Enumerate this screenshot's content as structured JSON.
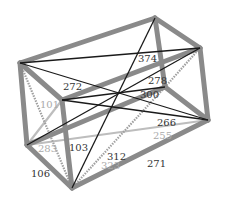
{
  "diagram": {
    "type": "3d-box-wireframe",
    "colors": {
      "edge": "#8a8a8a",
      "diagonal_dark": "#1a1a1a",
      "diagonal_light": "#bdbdbd",
      "dashed": "#a0a0a0",
      "label_dark": "#333333",
      "label_light": "#aaaaaa"
    },
    "vertices": {
      "A": [
        20,
        63
      ],
      "B": [
        155,
        18
      ],
      "C": [
        200,
        48
      ],
      "D": [
        62,
        100
      ],
      "E": [
        27,
        145
      ],
      "F": [
        72,
        188
      ],
      "G": [
        208,
        120
      ],
      "H": [
        165,
        87
      ]
    },
    "edges": [
      {
        "from": "A",
        "to": "B",
        "style": "edge"
      },
      {
        "from": "B",
        "to": "C",
        "style": "edge"
      },
      {
        "from": "C",
        "to": "D",
        "style": "edge"
      },
      {
        "from": "D",
        "to": "A",
        "style": "edge"
      },
      {
        "from": "A",
        "to": "E",
        "style": "edge"
      },
      {
        "from": "D",
        "to": "F",
        "style": "edge"
      },
      {
        "from": "C",
        "to": "G",
        "style": "edge"
      },
      {
        "from": "B",
        "to": "H",
        "style": "edge"
      },
      {
        "from": "E",
        "to": "F",
        "style": "edge"
      },
      {
        "from": "F",
        "to": "G",
        "style": "edge"
      },
      {
        "from": "G",
        "to": "H",
        "style": "edge"
      },
      {
        "from": "H",
        "to": "E",
        "style": "edge"
      }
    ],
    "diagonals": [
      {
        "from": "A",
        "to": "G",
        "style": "dark"
      },
      {
        "from": "B",
        "to": "F",
        "style": "dark"
      },
      {
        "from": "C",
        "to": "E",
        "style": "dark"
      },
      {
        "from": "D",
        "to": "H",
        "style": "dark"
      },
      {
        "from": "A",
        "to": "C",
        "style": "dark"
      },
      {
        "from": "D",
        "to": "G",
        "style": "dark"
      },
      {
        "from": "E",
        "to": "G",
        "style": "light"
      },
      {
        "from": "D",
        "to": "E",
        "style": "light"
      },
      {
        "from": "A",
        "to": "F",
        "style": "dashed"
      },
      {
        "from": "F",
        "to": "H",
        "style": "dashed"
      },
      {
        "from": "C",
        "to": "H",
        "style": "dashed"
      }
    ],
    "labels": [
      {
        "text": "374",
        "x": 138,
        "y": 62,
        "tone": "dark"
      },
      {
        "text": "272",
        "x": 63,
        "y": 90,
        "tone": "dark"
      },
      {
        "text": "278",
        "x": 148,
        "y": 84,
        "tone": "dark"
      },
      {
        "text": "300",
        "x": 140,
        "y": 98,
        "tone": "dark"
      },
      {
        "text": "101",
        "x": 40,
        "y": 108,
        "tone": "light"
      },
      {
        "text": "266",
        "x": 157,
        "y": 126,
        "tone": "dark"
      },
      {
        "text": "255",
        "x": 153,
        "y": 139,
        "tone": "light"
      },
      {
        "text": "103",
        "x": 69,
        "y": 151,
        "tone": "dark"
      },
      {
        "text": "283",
        "x": 38,
        "y": 152,
        "tone": "light"
      },
      {
        "text": "312",
        "x": 107,
        "y": 160,
        "tone": "dark"
      },
      {
        "text": "323",
        "x": 101,
        "y": 169,
        "tone": "light"
      },
      {
        "text": "271",
        "x": 147,
        "y": 167,
        "tone": "dark"
      },
      {
        "text": "106",
        "x": 31,
        "y": 177,
        "tone": "dark"
      }
    ]
  }
}
